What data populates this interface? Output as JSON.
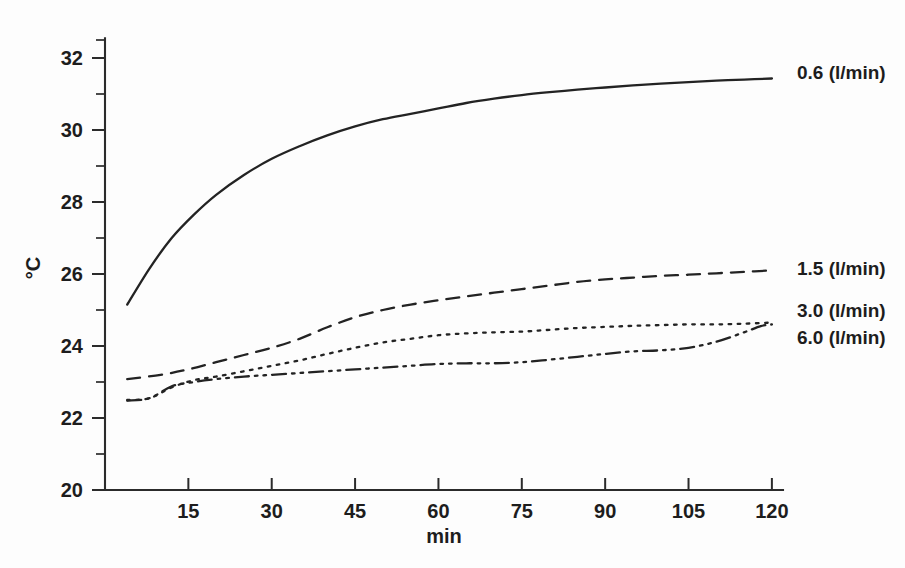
{
  "chart_data": {
    "type": "line",
    "title": "",
    "subtitle": "",
    "xlabel": "min",
    "ylabel": "°C",
    "xlim": [
      0,
      122
    ],
    "ylim": [
      20,
      32.6
    ],
    "xticks": [
      15,
      30,
      45,
      60,
      75,
      90,
      105,
      120
    ],
    "xtick_labels": [
      "15",
      "30",
      "45",
      "60",
      "75",
      "90",
      "105",
      "120"
    ],
    "yticks": [
      20,
      22,
      24,
      26,
      28,
      30,
      32
    ],
    "ytick_labels": [
      "20",
      "22",
      "24",
      "26",
      "28",
      "30",
      "32"
    ],
    "y_minor_ticks": [
      21,
      23,
      25,
      27,
      29,
      31,
      32.5
    ],
    "grid": false,
    "legend_position": "right-of-curve-ends",
    "series": [
      {
        "name": "0.6 (l/min)",
        "label": "0.6 (l/min)",
        "linestyle": "solid",
        "color": "#232323",
        "label_y_value": 31.55,
        "x": [
          4,
          8,
          12,
          16,
          20,
          25,
          30,
          35,
          40,
          45,
          50,
          55,
          60,
          65,
          70,
          75,
          80,
          85,
          90,
          95,
          100,
          105,
          110,
          115,
          120
        ],
        "y": [
          25.15,
          26.15,
          27.0,
          27.65,
          28.2,
          28.75,
          29.2,
          29.55,
          29.85,
          30.1,
          30.3,
          30.45,
          30.6,
          30.75,
          30.87,
          30.97,
          31.05,
          31.12,
          31.18,
          31.24,
          31.29,
          31.33,
          31.37,
          31.4,
          31.43
        ]
      },
      {
        "name": "1.5 (l/min)",
        "label": "1.5 (l/min)",
        "linestyle": "dashed",
        "color": "#232323",
        "label_y_value": 26.1,
        "x": [
          4,
          10,
          15,
          20,
          25,
          30,
          35,
          40,
          45,
          50,
          55,
          60,
          65,
          70,
          75,
          80,
          85,
          90,
          95,
          100,
          105,
          110,
          115,
          120
        ],
        "y": [
          23.08,
          23.2,
          23.35,
          23.55,
          23.75,
          23.95,
          24.2,
          24.52,
          24.8,
          25.0,
          25.15,
          25.27,
          25.38,
          25.48,
          25.58,
          25.68,
          25.78,
          25.85,
          25.9,
          25.95,
          25.98,
          26.02,
          26.06,
          26.1
        ]
      },
      {
        "name": "3.0 (l/min)",
        "label": "3.0 (l/min)",
        "linestyle": "dotted",
        "color": "#232323",
        "label_y_value": 24.95,
        "x": [
          4,
          8,
          12,
          16,
          20,
          25,
          30,
          35,
          40,
          45,
          50,
          55,
          60,
          65,
          70,
          75,
          80,
          85,
          90,
          95,
          100,
          105,
          110,
          115,
          120
        ],
        "y": [
          22.5,
          22.55,
          22.85,
          23.05,
          23.15,
          23.3,
          23.45,
          23.6,
          23.78,
          23.95,
          24.1,
          24.2,
          24.3,
          24.35,
          24.38,
          24.4,
          24.45,
          24.5,
          24.53,
          24.56,
          24.58,
          24.6,
          24.6,
          24.62,
          24.65
        ]
      },
      {
        "name": "6.0 (l/min)",
        "label": "6.0 (l/min)",
        "linestyle": "dashdot",
        "color": "#232323",
        "label_y_value": 24.2,
        "x": [
          4,
          8,
          12,
          16,
          20,
          25,
          30,
          35,
          40,
          45,
          50,
          55,
          60,
          65,
          70,
          75,
          80,
          85,
          90,
          95,
          100,
          105,
          110,
          115,
          118,
          120
        ],
        "y": [
          22.48,
          22.55,
          22.88,
          23.0,
          23.08,
          23.15,
          23.2,
          23.25,
          23.3,
          23.35,
          23.4,
          23.45,
          23.5,
          23.52,
          23.52,
          23.55,
          23.62,
          23.7,
          23.78,
          23.85,
          23.88,
          23.95,
          24.12,
          24.38,
          24.55,
          24.6
        ]
      }
    ]
  },
  "figure": {
    "background_color": "#fdfdfd",
    "ink_color": "#232323"
  }
}
